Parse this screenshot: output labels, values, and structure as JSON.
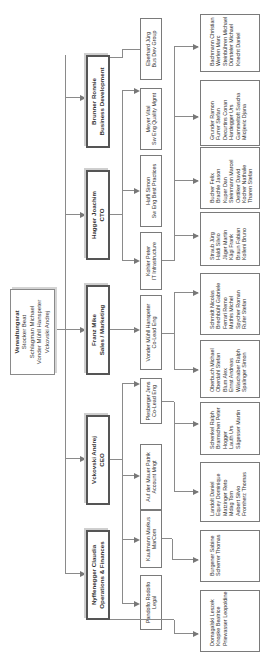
{
  "board": {
    "title": "Verwaltungsrat",
    "members": [
      "Stocker Beat",
      "Schlagman Michael",
      "Vonder Mühll Hanspeter",
      "Vckovski Andrej"
    ]
  },
  "executives": [
    {
      "name": "Nyffenegger Claudia",
      "role": "Operations & Finances"
    },
    {
      "name": "Vckovski Andrej",
      "role": "CEO"
    },
    {
      "name": "Franz Mike",
      "role": "Sales / Marketing"
    },
    {
      "name": "Hagger Joachim",
      "role": "CTO"
    },
    {
      "name": "Brunner Ronnie",
      "role": "Business Development"
    }
  ],
  "leads": [
    {
      "name": "Pandolfo Rodolfo",
      "role": "Legal"
    },
    {
      "name": "Kaufmann Markus",
      "role": "MarCom"
    },
    {
      "name": "Auf der Mauer Patrik",
      "role": "Account Mngt"
    },
    {
      "name": "Plesberger Jens",
      "role": "Co-Lead Eng"
    },
    {
      "name": "Vonder Mühll Hanspeter",
      "role": "Co-Lead Eng"
    },
    {
      "name": "Kohler Peter",
      "role": "IT Infrastructure"
    },
    {
      "name": "Haffi Simon",
      "role": "Sw Eng Best Practices"
    },
    {
      "name": "Meyer Vital",
      "role": "Sw Eng Quality Mgmt"
    },
    {
      "name": "Eberhard Jürg",
      "role": "Bus Dev Group"
    }
  ],
  "teams": [
    {
      "members": [
        "Domagalski Leszek",
        "Knopke Beatrice",
        "Priewasser Leopoldine"
      ]
    },
    {
      "members": [
        "Burgener Sabine",
        "Scherrer Thomas"
      ]
    },
    {
      "members": [
        "Landolt Daniel",
        "Equey Dominique",
        "Matzinger Reto",
        "Mdag Tom",
        "Aebert Silvio",
        "Fromherz Thomas"
      ]
    },
    {
      "members": [
        "Schenkel Ralph",
        "Bramschen Peter",
        "Hogger",
        "Lauth Urs",
        "Sägesser Martin"
      ]
    },
    {
      "members": [
        "Oberbuch Michael",
        "Oberdahl Stefan",
        "Blum Alex",
        "Ernst Andreas",
        "Wäschaber Ralph",
        "Spalinger Simon"
      ]
    },
    {
      "members": [
        "Schmidt Nicolas",
        "Brechbühl Gabriele",
        "Ferrari Remo",
        "Mathis Michel",
        "Spycher Roman",
        "Rufer Stefan"
      ]
    },
    {
      "members": [
        "Straub Jürg",
        "Haldi Silvio",
        "Jäger Martin",
        "Kägi Frank",
        "Braun Fabian",
        "Kolleni Bruno"
      ]
    },
    {
      "members": [
        "Bucher Felix",
        "Brachle Jason",
        "Kuper Dan",
        "Steinmann Marcel",
        "Oettiker David",
        "Kocher Nathalie",
        "Tharen Stefan"
      ]
    },
    {
      "members": [
        "Grunder Ramon",
        "Furrer Stefan",
        "Decurtins Conan",
        "Hardegger Urs",
        "Gammeltoft Sascha",
        "Micijevic Djana"
      ]
    },
    {
      "members": [
        "Bachmann Christian",
        "Werlen Marc",
        "Steinbühren Michael",
        "Dürsteler Michael",
        "Knecht Daniel"
      ]
    }
  ]
}
